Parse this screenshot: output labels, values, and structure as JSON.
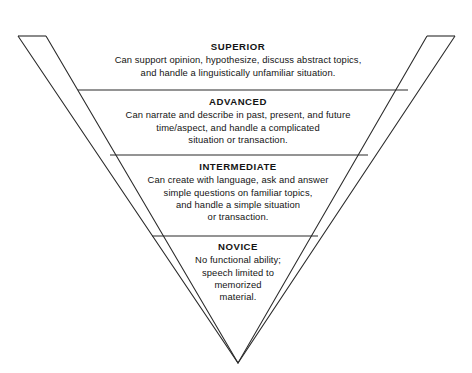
{
  "diagram": {
    "name": "inverted-proficiency-pyramid",
    "type": "inverted-pyramid",
    "orientation": "apex-down",
    "stroke_color": "#2b2b2b",
    "fill_color": "#ffffff",
    "background_color": "#ffffff",
    "text_color": "#141414",
    "levels": [
      {
        "id": "superior",
        "title": "SUPERIOR",
        "lines": [
          "Can support opinion, hypothesize, discuss abstract topics,",
          "and handle a linguistically unfamiliar situation."
        ]
      },
      {
        "id": "advanced",
        "title": "ADVANCED",
        "lines": [
          "Can narrate and describe in past, present, and future",
          "time/aspect, and handle a complicated",
          "situation or transaction."
        ]
      },
      {
        "id": "intermediate",
        "title": "INTERMEDIATE",
        "lines": [
          "Can create with language, ask and answer",
          "simple questions on familiar topics,",
          "and handle a simple situation",
          "or transaction."
        ]
      },
      {
        "id": "novice",
        "title": "NOVICE",
        "lines": [
          "No functional ability;",
          "speech limited to",
          "memorized",
          "material."
        ]
      }
    ]
  }
}
